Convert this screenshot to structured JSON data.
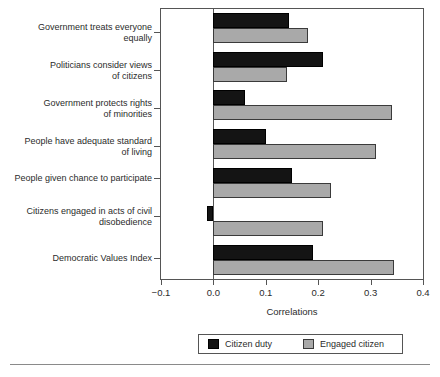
{
  "chart_data": {
    "type": "bar",
    "orientation": "horizontal",
    "title": "",
    "xlabel": "Correlations",
    "ylabel": "",
    "xlim": [
      -0.1,
      0.4
    ],
    "xticks": [
      "-0.1",
      "0.0",
      "0.1",
      "0.2",
      "0.3",
      "0.4"
    ],
    "xtick_values": [
      -0.1,
      0.0,
      0.1,
      0.2,
      0.3,
      0.4
    ],
    "grid": false,
    "legend_position": "bottom",
    "categories": [
      "Government treats everyone\nequally",
      "Politicians consider views\nof citizens",
      "Government protects rights\nof minorities",
      "People have adequate standard\nof living",
      "People given chance to participate",
      "Citizens engaged in acts of civil\ndisobedience",
      "Democratic Values Index"
    ],
    "series": [
      {
        "name": "Citizen duty",
        "color": "#141414",
        "values": [
          0.145,
          0.21,
          0.06,
          0.1,
          0.15,
          -0.013,
          0.19
        ]
      },
      {
        "name": "Engaged citizen",
        "color": "#a9a9a9",
        "values": [
          0.18,
          0.14,
          0.34,
          0.31,
          0.225,
          0.21,
          0.345
        ]
      }
    ]
  },
  "legend": {
    "entries": [
      {
        "label": "Citizen duty"
      },
      {
        "label": "Engaged citizen"
      }
    ]
  },
  "axis": {
    "x_title": "Correlations"
  }
}
